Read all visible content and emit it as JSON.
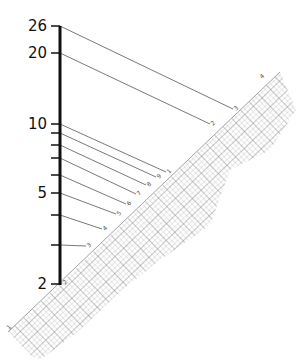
{
  "diagram": {
    "type": "log-scale nomogram projection onto diagonal log graph strip",
    "axis": {
      "x": 60,
      "top": 26,
      "bottom": 285,
      "ticks": [
        {
          "value": 26,
          "y": 26,
          "label": "26"
        },
        {
          "value": 20,
          "y": 53,
          "label": "20"
        },
        {
          "value": 10,
          "y": 124,
          "label": "10"
        },
        {
          "value": 9,
          "y": 133,
          "label": ""
        },
        {
          "value": 8,
          "y": 145,
          "label": ""
        },
        {
          "value": 7,
          "y": 158,
          "label": ""
        },
        {
          "value": 6,
          "y": 175,
          "label": ""
        },
        {
          "value": 5,
          "y": 193,
          "label": "5"
        },
        {
          "value": 4,
          "y": 215,
          "label": ""
        },
        {
          "value": 3,
          "y": 245,
          "label": ""
        },
        {
          "value": 2,
          "y": 284,
          "label": "2"
        }
      ]
    },
    "connectors": [
      {
        "from_value": 26,
        "to": [
          233,
          109
        ],
        "strip_label": "3"
      },
      {
        "from_value": 20,
        "to": [
          210,
          124
        ],
        "strip_label": "2"
      },
      {
        "from_value": 10,
        "to": [
          166,
          172
        ],
        "strip_label": "1"
      },
      {
        "from_value": 9,
        "to": [
          156,
          177
        ],
        "strip_label": "9"
      },
      {
        "from_value": 8,
        "to": [
          146,
          185
        ],
        "strip_label": "8"
      },
      {
        "from_value": 7,
        "to": [
          136,
          194
        ],
        "strip_label": "7"
      },
      {
        "from_value": 6,
        "to": [
          126,
          204
        ],
        "strip_label": "6"
      },
      {
        "from_value": 5,
        "to": [
          116,
          214
        ],
        "strip_label": "5"
      },
      {
        "from_value": 4,
        "to": [
          102,
          229
        ],
        "strip_label": "4"
      },
      {
        "from_value": 3,
        "to": [
          86,
          246
        ],
        "strip_label": "3"
      },
      {
        "from_value": 2,
        "to": [
          62,
          283
        ],
        "strip_label": "2"
      }
    ],
    "extra_strip_labels": [
      {
        "label": "4",
        "at": [
          262,
          79
        ]
      }
    ],
    "strip": {
      "start": [
        8,
        332
      ],
      "end": [
        280,
        72
      ],
      "label_start": "1"
    },
    "colors": {
      "axis": "#111111",
      "connector": "#555555",
      "grid": "#9a9a9a",
      "grid_major": "#6f6f6f"
    }
  }
}
